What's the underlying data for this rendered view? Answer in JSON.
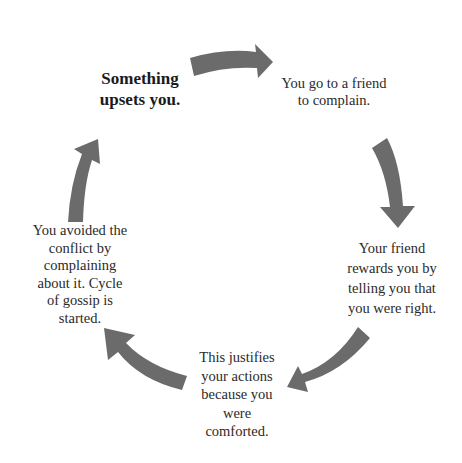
{
  "diagram": {
    "type": "cycle",
    "arrow_color": "#6b6b6b",
    "text_color": "#2a2a2a",
    "nodes": [
      {
        "id": "start",
        "lines": [
          "Something",
          "upsets you."
        ],
        "emphasis": "bold"
      },
      {
        "id": "complain",
        "lines": [
          "You go to a friend",
          "to complain."
        ]
      },
      {
        "id": "rewarded",
        "lines": [
          "Your friend",
          "rewards you by",
          "telling you that",
          "you were right."
        ]
      },
      {
        "id": "justified",
        "lines": [
          "This justifies",
          "your actions",
          "because you",
          "were",
          "comforted."
        ]
      },
      {
        "id": "avoided",
        "lines": [
          "You avoided the",
          "conflict by",
          "complaining",
          "about it. Cycle",
          "of gossip is",
          "started."
        ]
      }
    ],
    "arrows": [
      {
        "from": "start",
        "to": "complain",
        "direction": "right"
      },
      {
        "from": "complain",
        "to": "rewarded",
        "direction": "down"
      },
      {
        "from": "rewarded",
        "to": "justified",
        "direction": "down-left"
      },
      {
        "from": "justified",
        "to": "avoided",
        "direction": "up-left"
      },
      {
        "from": "avoided",
        "to": "start",
        "direction": "up"
      }
    ]
  }
}
